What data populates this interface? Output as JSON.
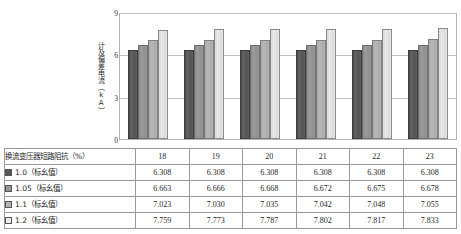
{
  "chart_data": {
    "type": "bar",
    "title": "",
    "xlabel": "",
    "ylabel": "计及偏差电流（kA）",
    "ylim": [
      0,
      9
    ],
    "yticks": [
      0,
      3,
      6,
      9
    ],
    "ytick_labels": [
      "0",
      "3",
      "6",
      "9"
    ],
    "grid": true,
    "legend_position": "table-row-labels",
    "categories": [
      "18",
      "19",
      "20",
      "21",
      "22",
      "23"
    ],
    "series": [
      {
        "name": "1.0（标幺值）",
        "color": "#595959",
        "values": [
          6.308,
          6.308,
          6.308,
          6.308,
          6.308,
          6.308
        ],
        "value_labels": [
          "6.308",
          "6.308",
          "6.308",
          "6.308",
          "6.308",
          "6.308"
        ]
      },
      {
        "name": "1.05（标幺值）",
        "color": "#949494",
        "values": [
          6.663,
          6.666,
          6.668,
          6.672,
          6.675,
          6.678
        ],
        "value_labels": [
          "6.663",
          "6.666",
          "6.668",
          "6.672",
          "6.675",
          "6.678"
        ]
      },
      {
        "name": "1.1（标幺值）",
        "color": "#b5b5b5",
        "values": [
          7.023,
          7.03,
          7.035,
          7.042,
          7.048,
          7.055
        ],
        "value_labels": [
          "7.023",
          "7.030",
          "7.035",
          "7.042",
          "7.048",
          "7.055"
        ]
      },
      {
        "name": "1.2（标幺值）",
        "color": "#ececec",
        "values": [
          7.759,
          7.773,
          7.787,
          7.802,
          7.817,
          7.833
        ],
        "value_labels": [
          "7.759",
          "7.773",
          "7.787",
          "7.802",
          "7.817",
          "7.833"
        ]
      }
    ]
  },
  "table": {
    "corner_header": "换流变压器短路阻抗（%）",
    "column_headers": [
      "18",
      "19",
      "20",
      "21",
      "22",
      "23"
    ],
    "rows": [
      {
        "label": "1.0（标幺值）",
        "swatch": "#595959",
        "values": [
          "6.308",
          "6.308",
          "6.308",
          "6.308",
          "6.308",
          "6.308"
        ]
      },
      {
        "label": "1.05（标幺值）",
        "swatch": "#949494",
        "values": [
          "6.663",
          "6.666",
          "6.668",
          "6.672",
          "6.675",
          "6.678"
        ]
      },
      {
        "label": "1.1（标幺值）",
        "swatch": "#b5b5b5",
        "values": [
          "7.023",
          "7.030",
          "7.035",
          "7.042",
          "7.048",
          "7.055"
        ]
      },
      {
        "label": "1.2（标幺值）",
        "swatch": "#ececec",
        "values": [
          "7.759",
          "7.773",
          "7.787",
          "7.802",
          "7.817",
          "7.833"
        ]
      }
    ]
  },
  "colors": {
    "plot_border": "#b3b3b3",
    "gridline": "#bfbfbf",
    "table_border": "#999999",
    "background": "#ffffff",
    "text": "#1f1f1f"
  }
}
